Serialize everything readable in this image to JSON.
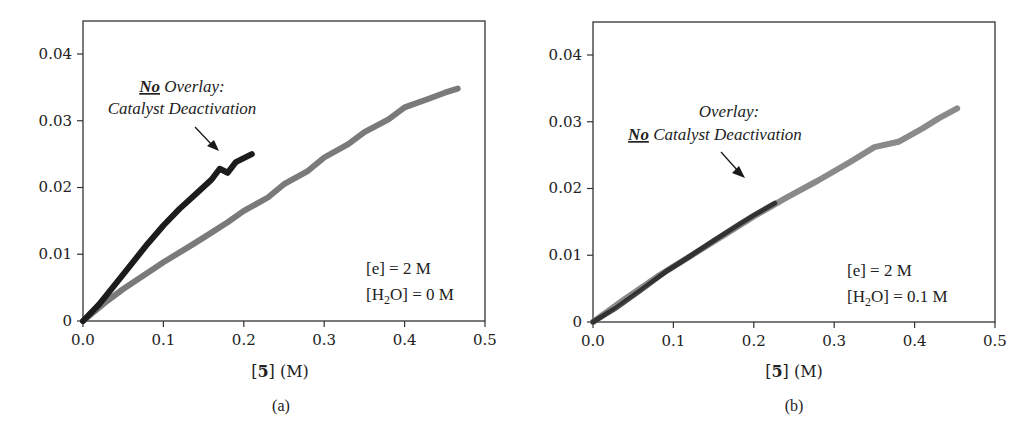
{
  "chart_data": [
    {
      "type": "line",
      "panel": "(a)",
      "title": "",
      "xlabel": "[5] (M)",
      "ylabel": "",
      "xlim": [
        0,
        0.5
      ],
      "ylim": [
        0,
        0.045
      ],
      "x_ticks": [
        "0.0",
        "0.1",
        "0.2",
        "0.3",
        "0.4",
        "0.5"
      ],
      "y_ticks": [
        "0",
        "0.01",
        "0.02",
        "0.03",
        "0.04"
      ],
      "grid": false,
      "annotation": {
        "emphasis": "No",
        "line1_rest": " Overlay:",
        "line2": "Catalyst Deactivation"
      },
      "conditions": [
        "[e] = 2 M",
        "[H2O] = 0 M"
      ],
      "series": [
        {
          "name": "black (shorter run)",
          "color": "#1c1c1c",
          "x": [
            0.0,
            0.02,
            0.04,
            0.06,
            0.08,
            0.1,
            0.12,
            0.14,
            0.16,
            0.17,
            0.18,
            0.19,
            0.21
          ],
          "y": [
            0.0,
            0.0025,
            0.0055,
            0.0085,
            0.0115,
            0.0143,
            0.0168,
            0.019,
            0.0212,
            0.0228,
            0.0222,
            0.0238,
            0.025
          ]
        },
        {
          "name": "gray (longer run)",
          "color": "#7a7a7a",
          "x": [
            0.0,
            0.03,
            0.05,
            0.08,
            0.1,
            0.13,
            0.15,
            0.18,
            0.2,
            0.23,
            0.25,
            0.28,
            0.3,
            0.33,
            0.35,
            0.38,
            0.4,
            0.43,
            0.45,
            0.466
          ],
          "y": [
            0.0,
            0.003,
            0.0048,
            0.0072,
            0.0088,
            0.011,
            0.0125,
            0.0148,
            0.0165,
            0.0185,
            0.0205,
            0.0225,
            0.0245,
            0.0265,
            0.0283,
            0.0302,
            0.032,
            0.0333,
            0.0342,
            0.0348
          ]
        }
      ]
    },
    {
      "type": "line",
      "panel": "(b)",
      "title": "",
      "xlabel": "[5] (M)",
      "ylabel": "",
      "xlim": [
        0,
        0.5
      ],
      "ylim": [
        0,
        0.045
      ],
      "x_ticks": [
        "0.0",
        "0.1",
        "0.2",
        "0.3",
        "0.4",
        "0.5"
      ],
      "y_ticks": [
        "0",
        "0.01",
        "0.02",
        "0.03",
        "0.04"
      ],
      "grid": false,
      "annotation": {
        "line1": "Overlay:",
        "emphasis": "No",
        "line2_rest": " Catalyst Deactivation"
      },
      "conditions": [
        "[e] = 2 M",
        "[H2O] = 0.1 M"
      ],
      "series": [
        {
          "name": "black (shorter run)",
          "color": "#1c1c1c",
          "x": [
            0.0,
            0.03,
            0.06,
            0.09,
            0.12,
            0.15,
            0.18,
            0.2,
            0.226
          ],
          "y": [
            0.0,
            0.0022,
            0.0048,
            0.0075,
            0.0098,
            0.0122,
            0.0145,
            0.016,
            0.0178
          ]
        },
        {
          "name": "gray (longer run)",
          "color": "#8a8a8a",
          "x": [
            0.0,
            0.04,
            0.08,
            0.12,
            0.16,
            0.2,
            0.24,
            0.28,
            0.32,
            0.35,
            0.38,
            0.41,
            0.43,
            0.453
          ],
          "y": [
            0.0,
            0.0035,
            0.0068,
            0.0098,
            0.0128,
            0.0158,
            0.0186,
            0.0212,
            0.024,
            0.0262,
            0.027,
            0.029,
            0.0305,
            0.032
          ]
        }
      ]
    }
  ],
  "panels": [
    {
      "letter": "(a)",
      "xlabel_open": "[",
      "xlabel_bold": "5",
      "xlabel_close": "] (M)",
      "x_ticks": [
        "0.0",
        "0.1",
        "0.2",
        "0.3",
        "0.4",
        "0.5"
      ],
      "y_ticks": [
        "0",
        "0.01",
        "0.02",
        "0.03",
        "0.04"
      ],
      "annotation_line1_bold": "No",
      "annotation_line1_rest": " Overlay:",
      "annotation_line2": "Catalyst Deactivation",
      "cond_e": "[e] = 2 M",
      "cond_h2o_pre": "[H",
      "cond_h2o_sub": "2",
      "cond_h2o_post": "O] = 0 M"
    },
    {
      "letter": "(b)",
      "xlabel_open": "[",
      "xlabel_bold": "5",
      "xlabel_close": "] (M)",
      "x_ticks": [
        "0.0",
        "0.1",
        "0.2",
        "0.3",
        "0.4",
        "0.5"
      ],
      "y_ticks": [
        "0",
        "0.01",
        "0.02",
        "0.03",
        "0.04"
      ],
      "annotation_line1": "Overlay:",
      "annotation_line2_bold": "No",
      "annotation_line2_rest": " Catalyst Deactivation",
      "cond_e": "[e] = 2 M",
      "cond_h2o_pre": "[H",
      "cond_h2o_sub": "2",
      "cond_h2o_post": "O] = 0.1 M"
    }
  ]
}
